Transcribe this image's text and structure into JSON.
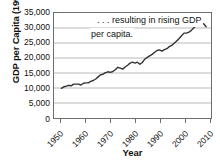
{
  "chart_data": {
    "type": "line",
    "title": "",
    "annotation": {
      "line1": ". . . resulting in rising GDP",
      "line2": "per capita."
    },
    "xlabel": "Year",
    "ylabel": "GDP per Capita (1990$)",
    "xlim": [
      1947,
      2011
    ],
    "ylim": [
      0,
      35000
    ],
    "grid": true,
    "legend": null,
    "line_color": "#333333",
    "y_ticks": [
      {
        "value": 35000,
        "label": "35,000"
      },
      {
        "value": 30000,
        "label": "30,000"
      },
      {
        "value": 25000,
        "label": "25,000"
      },
      {
        "value": 20000,
        "label": "20,000"
      },
      {
        "value": 15000,
        "label": "15,000"
      },
      {
        "value": 10000,
        "label": "10,000"
      },
      {
        "value": 5000,
        "label": "5,000"
      },
      {
        "value": 0,
        "label": "0"
      }
    ],
    "x_ticks": [
      {
        "value": 1950,
        "label": "1950"
      },
      {
        "value": 1960,
        "label": "1960"
      },
      {
        "value": 1970,
        "label": "1970"
      },
      {
        "value": 1980,
        "label": "1980"
      },
      {
        "value": 1990,
        "label": "1990"
      },
      {
        "value": 2000,
        "label": "2000"
      },
      {
        "value": 2010,
        "label": "2010"
      }
    ],
    "x": [
      1950,
      1951,
      1952,
      1953,
      1954,
      1955,
      1956,
      1957,
      1958,
      1959,
      1960,
      1961,
      1962,
      1963,
      1964,
      1965,
      1966,
      1967,
      1968,
      1969,
      1970,
      1971,
      1972,
      1973,
      1974,
      1975,
      1976,
      1977,
      1978,
      1979,
      1980,
      1981,
      1982,
      1983,
      1984,
      1985,
      1986,
      1987,
      1988,
      1989,
      1990,
      1991,
      1992,
      1993,
      1994,
      1995,
      1996,
      1997,
      1998,
      1999,
      2000,
      2001,
      2002,
      2003,
      2004,
      2005,
      2006,
      2007,
      2008,
      2009
    ],
    "values": [
      9900,
      10400,
      10600,
      10900,
      10700,
      11300,
      11300,
      11300,
      11000,
      11600,
      11700,
      11700,
      12200,
      12500,
      13000,
      13700,
      14400,
      14600,
      15100,
      15400,
      15200,
      15500,
      16100,
      16900,
      16600,
      16300,
      17000,
      17600,
      18300,
      18600,
      18300,
      18600,
      17900,
      18500,
      19600,
      20200,
      20700,
      21200,
      21900,
      22500,
      22700,
      22300,
      22800,
      23100,
      23800,
      24200,
      24900,
      25700,
      26500,
      27400,
      28300,
      28300,
      28600,
      29200,
      30100,
      30800,
      31400,
      31700,
      31400,
      30400
    ]
  }
}
